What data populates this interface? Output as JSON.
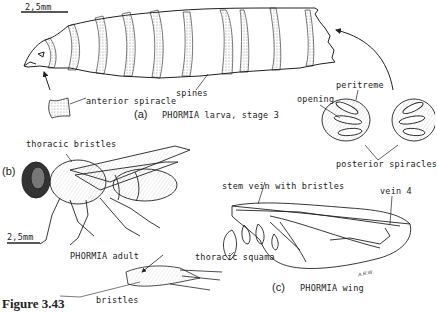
{
  "figure": {
    "caption": "Figure 3.43",
    "artist_initials": "A.R.W."
  },
  "panel_a": {
    "letter": "(a)",
    "title": "PHORMIA larva, stage 3",
    "scale_bar": "2,5mm",
    "labels": {
      "anterior_spiracle": "anterior spiracle",
      "spines": "spines",
      "peritreme": "peritreme",
      "opening": "opening",
      "posterior_spiracles": "posterior spiracles"
    }
  },
  "panel_b": {
    "letter": "(b)",
    "title": "PHORMIA adult",
    "scale_bar": "2,5mm",
    "labels": {
      "thoracic_bristles": "thoracic bristles",
      "bristles": "bristles"
    }
  },
  "panel_c": {
    "letter": "(c)",
    "title": "PHORMIA wing",
    "labels": {
      "stem_vein": "stem vein with bristles",
      "vein_4": "vein 4",
      "thoracic_squama": "thoracic squama"
    }
  },
  "colors": {
    "ink": "#222222",
    "stipple": "#888888",
    "background": "#ffffff"
  }
}
